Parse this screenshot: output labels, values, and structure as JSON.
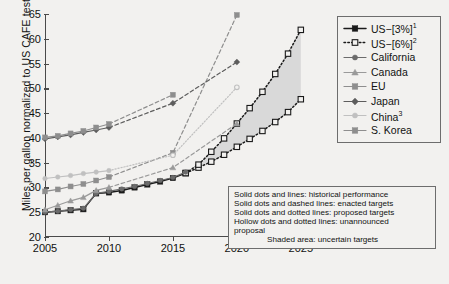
{
  "chart_data": {
    "type": "line",
    "title": "",
    "xlabel": "",
    "ylabel": "Miles per gallon normalized to US CAFE test cycle",
    "xlim": [
      2005,
      2026.5
    ],
    "ylim": [
      20,
      65
    ],
    "xticks": [
      2005,
      2010,
      2015,
      2020,
      2025
    ],
    "yticks": [
      20,
      25,
      30,
      35,
      40,
      45,
      50,
      55,
      60,
      65
    ],
    "grid": false,
    "legend_position": "right-top",
    "shaded_area": {
      "label": "uncertain targets",
      "color": "#d9d9d9",
      "between_series": [
        "US-[6%]",
        "US-[3%]"
      ],
      "x_range": [
        2016.8,
        2025
      ]
    },
    "series": [
      {
        "name": "US-[3%]",
        "legend_label": "US−[3%]",
        "footnote": "1",
        "color": "#1a1a1a",
        "marker": "square",
        "marker_fill": "solid",
        "x": [
          2005,
          2006,
          2007,
          2008,
          2009,
          2010,
          2011,
          2012,
          2013,
          2014,
          2015,
          2016,
          2017,
          2018,
          2019,
          2020,
          2021,
          2022,
          2023,
          2024,
          2025
        ],
        "y": [
          25.0,
          25.2,
          25.4,
          25.6,
          28.8,
          29.0,
          29.4,
          30.0,
          30.6,
          31.2,
          31.9,
          32.9,
          34.0,
          35.2,
          36.6,
          38.2,
          39.8,
          41.4,
          43.2,
          45.2,
          47.8
        ],
        "style_segments": [
          {
            "from": 2005,
            "to": 2016,
            "line": "solid",
            "fill": "solid",
            "meaning": "historical performance"
          },
          {
            "from": 2016,
            "to": 2025,
            "line": "dotted",
            "fill": "hollow",
            "meaning": "unannounced proposal"
          }
        ]
      },
      {
        "name": "US-[6%]",
        "legend_label": "US−[6%]",
        "footnote": "2",
        "color": "#1a1a1a",
        "marker": "square",
        "marker_fill": "hollow",
        "x": [
          2016,
          2017,
          2018,
          2019,
          2020,
          2021,
          2022,
          2023,
          2024,
          2025
        ],
        "y": [
          32.9,
          34.6,
          37.2,
          39.9,
          42.9,
          46.0,
          49.3,
          52.9,
          57.0,
          61.8
        ],
        "style_segments": [
          {
            "from": 2016,
            "to": 2025,
            "line": "dotted",
            "fill": "hollow",
            "meaning": "unannounced proposal"
          }
        ]
      },
      {
        "name": "California",
        "legend_label": "California",
        "footnote": "",
        "color": "#6b6b6b",
        "marker": "circle",
        "marker_fill": "solid",
        "x": [
          2005,
          2006,
          2007,
          2008,
          2009,
          2010,
          2011,
          2012,
          2013,
          2014,
          2015,
          2016
        ],
        "y": [
          25.0,
          25.2,
          25.5,
          25.8,
          28.8,
          29.2,
          29.7,
          30.2,
          30.8,
          31.4,
          32.0,
          33.1
        ],
        "style_segments": [
          {
            "from": 2005,
            "to": 2016,
            "line": "solid",
            "fill": "solid",
            "meaning": "historical performance"
          }
        ]
      },
      {
        "name": "Canada",
        "legend_label": "Canada",
        "footnote": "",
        "color": "#9a9a9a",
        "marker": "triangle",
        "marker_fill": "solid",
        "x": [
          2005,
          2006,
          2007,
          2008,
          2009,
          2010,
          2015,
          2020
        ],
        "y": [
          25.5,
          26.4,
          27.3,
          28.0,
          29.4,
          30.0,
          34.0,
          42.9
        ],
        "style_segments": [
          {
            "from": 2005,
            "to": 2010,
            "line": "solid",
            "fill": "solid",
            "meaning": "historical performance"
          },
          {
            "from": 2010,
            "to": 2020,
            "line": "dashed",
            "fill": "solid",
            "meaning": "enacted targets"
          }
        ]
      },
      {
        "name": "EU",
        "legend_label": "EU",
        "footnote": "",
        "color": "#8e8e8e",
        "marker": "square",
        "marker_fill": "solid",
        "x": [
          2005,
          2006,
          2007,
          2008,
          2009,
          2010,
          2015,
          2020
        ],
        "y": [
          29.2,
          29.6,
          30.2,
          30.7,
          31.4,
          32.1,
          37.0,
          64.8
        ],
        "style_segments": [
          {
            "from": 2005,
            "to": 2010,
            "line": "solid",
            "fill": "solid",
            "meaning": "historical performance"
          },
          {
            "from": 2010,
            "to": 2020,
            "line": "dashed",
            "fill": "solid",
            "meaning": "enacted targets"
          }
        ]
      },
      {
        "name": "Japan",
        "legend_label": "Japan",
        "footnote": "",
        "color": "#5d5d5d",
        "marker": "diamond",
        "marker_fill": "solid",
        "x": [
          2005,
          2006,
          2007,
          2008,
          2009,
          2010,
          2015,
          2020
        ],
        "y": [
          39.8,
          40.2,
          40.6,
          41.1,
          41.6,
          42.1,
          47.0,
          55.3
        ],
        "style_segments": [
          {
            "from": 2005,
            "to": 2010,
            "line": "solid",
            "fill": "solid",
            "meaning": "historical performance"
          },
          {
            "from": 2010,
            "to": 2020,
            "line": "dashed",
            "fill": "solid",
            "meaning": "enacted targets"
          }
        ]
      },
      {
        "name": "China",
        "legend_label": "China",
        "footnote": "3",
        "color": "#c0c0c0",
        "marker": "circle",
        "marker_fill": "solid",
        "x": [
          2005,
          2006,
          2007,
          2008,
          2009,
          2010,
          2015,
          2020
        ],
        "y": [
          31.8,
          32.1,
          32.4,
          32.8,
          33.1,
          33.4,
          36.5,
          50.2
        ],
        "style_segments": [
          {
            "from": 2005,
            "to": 2010,
            "line": "solid",
            "fill": "solid",
            "meaning": "historical performance"
          },
          {
            "from": 2010,
            "to": 2015,
            "line": "dotted",
            "fill": "solid",
            "meaning": "proposed targets"
          },
          {
            "from": 2015,
            "to": 2020,
            "line": "dotted",
            "fill": "hollow",
            "meaning": "unannounced proposal"
          }
        ]
      },
      {
        "name": "S. Korea",
        "legend_label": "S. Korea",
        "footnote": "",
        "color": "#8e8e8e",
        "marker": "square",
        "marker_fill": "solid",
        "x": [
          2005,
          2006,
          2007,
          2008,
          2009,
          2010,
          2015
        ],
        "y": [
          40.1,
          40.4,
          40.9,
          41.4,
          42.1,
          42.8,
          48.7
        ],
        "style_segments": [
          {
            "from": 2005,
            "to": 2010,
            "line": "solid",
            "fill": "solid",
            "meaning": "historical performance"
          },
          {
            "from": 2010,
            "to": 2015,
            "line": "dashed",
            "fill": "solid",
            "meaning": "enacted targets"
          }
        ]
      }
    ]
  },
  "legend": {
    "items": [
      {
        "label": "US−[3%]",
        "sup": "1"
      },
      {
        "label": "US−[6%]",
        "sup": "2"
      },
      {
        "label": "California",
        "sup": ""
      },
      {
        "label": "Canada",
        "sup": ""
      },
      {
        "label": "EU",
        "sup": ""
      },
      {
        "label": "Japan",
        "sup": ""
      },
      {
        "label": "China",
        "sup": "3"
      },
      {
        "label": "S. Korea",
        "sup": ""
      }
    ]
  },
  "notes": {
    "lines": [
      "Solid dots and lines: historical performance",
      "Solid dots and dashed lines: enacted targets",
      "Solid dots and dotted lines: proposed targets",
      "Hollow dots and dotted lines: unannounced",
      "proposal",
      "Shaded area: uncertain targets"
    ]
  }
}
